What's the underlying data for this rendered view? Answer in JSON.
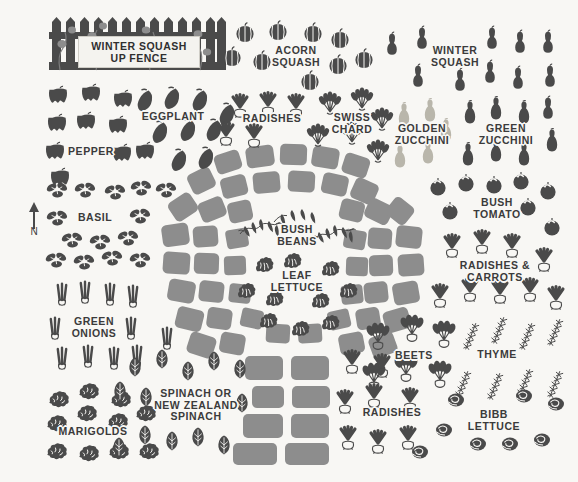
{
  "plan": {
    "title": "Vegetable Garden Planting Plan",
    "background_color": "#f8f7f4",
    "ink_color": "#4a4a4a",
    "stone_color": "#8d8d8d",
    "label_color": "#3b3b3b",
    "golden_color": "#b9b6ab",
    "width": 578,
    "height": 482
  },
  "compass": {
    "direction_label": "N"
  },
  "fence_sign": {
    "text": "WINTER SQUASH\nUP FENCE"
  },
  "labels": [
    {
      "id": "acorn-squash",
      "text": "ACORN\nSQUASH",
      "x": 296,
      "y": 56
    },
    {
      "id": "winter-squash",
      "text": "WINTER\nSQUASH",
      "x": 455,
      "y": 56
    },
    {
      "id": "eggplant",
      "text": "EGGPLANT",
      "x": 173,
      "y": 117
    },
    {
      "id": "radishes-top",
      "text": "RADISHES",
      "x": 272,
      "y": 119
    },
    {
      "id": "swiss-chard",
      "text": "SWISS\nCHARD",
      "x": 352,
      "y": 123
    },
    {
      "id": "golden-zucchini",
      "text": "GOLDEN\nZUCCHINI",
      "x": 422,
      "y": 134
    },
    {
      "id": "green-zucchini",
      "text": "GREEN\nZUCCHINI",
      "x": 506,
      "y": 134
    },
    {
      "id": "pepper",
      "text": "PEPPER",
      "x": 91,
      "y": 152
    },
    {
      "id": "basil",
      "text": "BASIL",
      "x": 95,
      "y": 218
    },
    {
      "id": "bush-tomato",
      "text": "BUSH\nTOMATO",
      "x": 497,
      "y": 208
    },
    {
      "id": "bush-beans",
      "text": "BUSH\nBEANS",
      "x": 297,
      "y": 235
    },
    {
      "id": "radishes-carrots",
      "text": "RADISHES &\nCARROTS",
      "x": 495,
      "y": 271
    },
    {
      "id": "leaf-lettuce",
      "text": "LEAF\nLETTUCE",
      "x": 297,
      "y": 281
    },
    {
      "id": "green-onions",
      "text": "GREEN\nONIONS",
      "x": 94,
      "y": 327
    },
    {
      "id": "beets",
      "text": "BEETS",
      "x": 414,
      "y": 356
    },
    {
      "id": "thyme",
      "text": "THYME",
      "x": 497,
      "y": 355
    },
    {
      "id": "spinach",
      "text": "SPINACH OR\nNEW ZEALAND\nSPINACH",
      "x": 196,
      "y": 405
    },
    {
      "id": "radishes-bottom",
      "text": "RADISHES",
      "x": 392,
      "y": 413
    },
    {
      "id": "bibb-lettuce",
      "text": "BIBB\nLETTUCE",
      "x": 494,
      "y": 420
    },
    {
      "id": "marigolds",
      "text": "MARIGOLDS",
      "x": 93,
      "y": 432
    }
  ],
  "beds": [
    {
      "id": "winter-squash-fence",
      "crop": "Winter Squash up fence",
      "region": "top-left"
    },
    {
      "id": "acorn-squash-bed",
      "crop": "Acorn Squash",
      "region": "top-center"
    },
    {
      "id": "winter-squash-bed",
      "crop": "Winter Squash",
      "region": "top-right"
    },
    {
      "id": "pepper-bed",
      "crop": "Pepper",
      "region": "upper-left"
    },
    {
      "id": "eggplant-bed",
      "crop": "Eggplant",
      "region": "upper-left"
    },
    {
      "id": "radish-bed-top",
      "crop": "Radishes",
      "region": "upper-center"
    },
    {
      "id": "swiss-chard-bed",
      "crop": "Swiss Chard",
      "region": "upper-center"
    },
    {
      "id": "golden-zucchini-bed",
      "crop": "Golden Zucchini",
      "region": "upper-right"
    },
    {
      "id": "green-zucchini-bed",
      "crop": "Green Zucchini",
      "region": "upper-right"
    },
    {
      "id": "basil-bed",
      "crop": "Basil",
      "region": "left"
    },
    {
      "id": "green-onion-bed",
      "crop": "Green Onions",
      "region": "lower-left"
    },
    {
      "id": "marigold-bed",
      "crop": "Marigolds",
      "region": "bottom-left"
    },
    {
      "id": "spinach-bed",
      "crop": "Spinach or New Zealand Spinach",
      "region": "bottom-center"
    },
    {
      "id": "bush-beans-bed",
      "crop": "Bush Beans",
      "region": "center"
    },
    {
      "id": "leaf-lettuce-bed",
      "crop": "Leaf Lettuce",
      "region": "center"
    },
    {
      "id": "bush-tomato-bed",
      "crop": "Bush Tomato",
      "region": "right"
    },
    {
      "id": "radish-carrot-bed",
      "crop": "Radishes & Carrots",
      "region": "right"
    },
    {
      "id": "beet-bed",
      "crop": "Beets",
      "region": "bottom-right"
    },
    {
      "id": "thyme-bed",
      "crop": "Thyme",
      "region": "bottom-right"
    },
    {
      "id": "radish-bed-bottom",
      "crop": "Radishes",
      "region": "bottom-right"
    },
    {
      "id": "bibb-lettuce-bed",
      "crop": "Bibb Lettuce",
      "region": "bottom-right"
    }
  ]
}
